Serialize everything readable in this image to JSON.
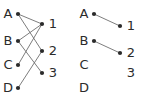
{
  "figure": {
    "background_color": "#ffffff",
    "edge_color": "#6e6e6e",
    "vertex_color": "#2b2b2b",
    "label_color": "#2b2b2b"
  },
  "panels": [
    {
      "id": "left-panel",
      "name": "bipartite-graph-full",
      "left_labels": [
        "A",
        "B",
        "C",
        "D"
      ],
      "right_labels": [
        "1",
        "2",
        "3"
      ],
      "left_vertices": [
        {
          "label": "A",
          "x": 18,
          "y": 14,
          "visible": true
        },
        {
          "label": "B",
          "x": 18,
          "y": 41,
          "visible": true
        },
        {
          "label": "C",
          "x": 18,
          "y": 65,
          "visible": true
        },
        {
          "label": "D",
          "x": 18,
          "y": 88,
          "visible": true
        }
      ],
      "right_vertices": [
        {
          "label": "1",
          "x": 42,
          "y": 24,
          "visible": true
        },
        {
          "label": "2",
          "x": 42,
          "y": 51,
          "visible": true
        },
        {
          "label": "3",
          "x": 42,
          "y": 73,
          "visible": true
        }
      ],
      "left_label_positions": [
        {
          "label": "A",
          "x": 8,
          "y": 14
        },
        {
          "label": "B",
          "x": 8,
          "y": 41
        },
        {
          "label": "C",
          "x": 8,
          "y": 65
        },
        {
          "label": "D",
          "x": 8,
          "y": 88
        }
      ],
      "right_label_positions": [
        {
          "label": "1",
          "x": 53,
          "y": 24
        },
        {
          "label": "2",
          "x": 53,
          "y": 51
        },
        {
          "label": "3",
          "x": 53,
          "y": 73
        }
      ],
      "edges": [
        {
          "from": "A",
          "to": "1",
          "x1": 18,
          "y1": 14,
          "x2": 42,
          "y2": 24
        },
        {
          "from": "A",
          "to": "2",
          "x1": 18,
          "y1": 14,
          "x2": 42,
          "y2": 51
        },
        {
          "from": "B",
          "to": "1",
          "x1": 18,
          "y1": 41,
          "x2": 42,
          "y2": 24
        },
        {
          "from": "B",
          "to": "3",
          "x1": 18,
          "y1": 41,
          "x2": 42,
          "y2": 73
        },
        {
          "from": "C",
          "to": "1",
          "x1": 18,
          "y1": 65,
          "x2": 42,
          "y2": 24
        },
        {
          "from": "D",
          "to": "2",
          "x1": 18,
          "y1": 88,
          "x2": 42,
          "y2": 51
        }
      ]
    },
    {
      "id": "right-panel",
      "name": "bipartite-graph-matching",
      "left_labels": [
        "A",
        "B",
        "C",
        "D"
      ],
      "right_labels": [
        "1",
        "2",
        "3"
      ],
      "left_vertices": [
        {
          "label": "A",
          "x": 94,
          "y": 14,
          "visible": true
        },
        {
          "label": "B",
          "x": 94,
          "y": 41,
          "visible": true
        },
        {
          "label": "C",
          "x": 94,
          "y": 65,
          "visible": false
        },
        {
          "label": "D",
          "x": 94,
          "y": 88,
          "visible": false
        }
      ],
      "right_vertices": [
        {
          "label": "1",
          "x": 120,
          "y": 26,
          "visible": true
        },
        {
          "label": "2",
          "x": 120,
          "y": 53,
          "visible": true
        },
        {
          "label": "3",
          "x": 120,
          "y": 73,
          "visible": false
        }
      ],
      "left_label_positions": [
        {
          "label": "A",
          "x": 84,
          "y": 14
        },
        {
          "label": "B",
          "x": 84,
          "y": 41
        },
        {
          "label": "C",
          "x": 84,
          "y": 65
        },
        {
          "label": "D",
          "x": 84,
          "y": 88
        }
      ],
      "right_label_positions": [
        {
          "label": "1",
          "x": 131,
          "y": 26
        },
        {
          "label": "2",
          "x": 131,
          "y": 53
        },
        {
          "label": "3",
          "x": 131,
          "y": 73
        }
      ],
      "edges": [
        {
          "from": "A",
          "to": "1",
          "x1": 94,
          "y1": 14,
          "x2": 120,
          "y2": 26
        },
        {
          "from": "B",
          "to": "2",
          "x1": 94,
          "y1": 41,
          "x2": 120,
          "y2": 53
        }
      ]
    }
  ],
  "chart_data": {
    "type": "diagram",
    "subtype": "bipartite-graph",
    "left_set": [
      "A",
      "B",
      "C",
      "D"
    ],
    "right_set": [
      "1",
      "2",
      "3"
    ],
    "graphs": [
      {
        "name": "full-graph",
        "edges": [
          [
            "A",
            "1"
          ],
          [
            "A",
            "2"
          ],
          [
            "B",
            "1"
          ],
          [
            "B",
            "3"
          ],
          [
            "C",
            "1"
          ],
          [
            "D",
            "2"
          ]
        ],
        "edge_count": 6
      },
      {
        "name": "matching",
        "edges": [
          [
            "A",
            "1"
          ],
          [
            "B",
            "2"
          ]
        ],
        "edge_count": 2
      }
    ]
  }
}
